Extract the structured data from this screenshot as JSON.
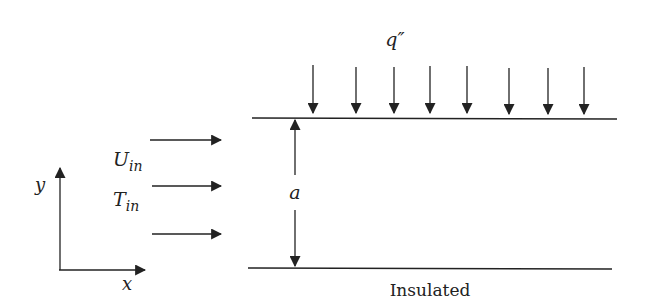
{
  "labels": {
    "heat_flux": "q″",
    "inlet_velocity_main": "U",
    "inlet_velocity_sub": "in",
    "inlet_temp_main": "T",
    "inlet_temp_sub": "in",
    "gap": "a",
    "axis_x": "x",
    "axis_y": "y",
    "bottom_wall": "Insulated"
  },
  "colors": {
    "stroke": "#222222",
    "background": "#ffffff"
  }
}
